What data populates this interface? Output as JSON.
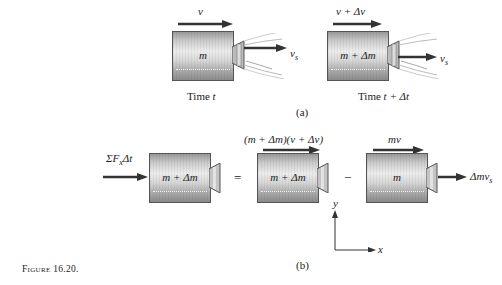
{
  "figure": {
    "caption": "Figure 16.20.",
    "part_a": {
      "label": "(a)",
      "left": {
        "mass_label": "m",
        "velocity_label": "v",
        "exhaust_label": "v",
        "exhaust_subscript": "s",
        "time_label_prefix": "Time ",
        "time_label_var": "t"
      },
      "right": {
        "mass_label": "m + Δm",
        "velocity_label": "v + Δv",
        "exhaust_label": "v",
        "exhaust_subscript": "s",
        "time_label_prefix": "Time ",
        "time_label_var": "t + Δt"
      }
    },
    "part_b": {
      "label": "(b)",
      "impulse_label": "ΣF",
      "impulse_subscript": "x",
      "impulse_suffix": "Δt",
      "body1_mass": "m + Δm",
      "equals": "=",
      "body2_mass": "m + Δm",
      "body2_momentum": "(m + Δm)(v + Δv)",
      "minus": "−",
      "body3_mass": "m",
      "body3_momentum": "mv",
      "exhaust_momentum": "Δmv",
      "exhaust_subscript": "s",
      "axis_y": "y",
      "axis_x": "x"
    }
  }
}
